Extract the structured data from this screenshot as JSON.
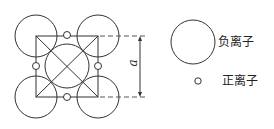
{
  "diagram": {
    "dimension_label": "a",
    "legend": [
      {
        "symbol": "large-circle",
        "label": "负离子"
      },
      {
        "symbol": "small-circle",
        "label": "正离子"
      }
    ],
    "colors": {
      "line": "#333333",
      "background": "#ffffff"
    }
  }
}
